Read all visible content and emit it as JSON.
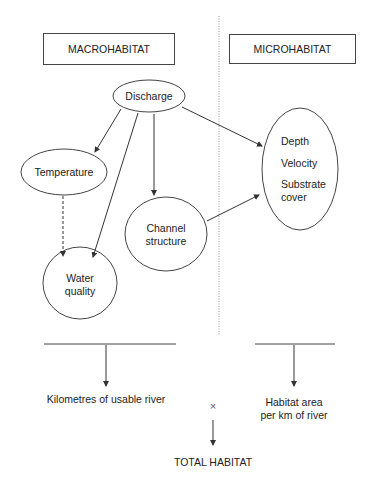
{
  "headers": {
    "left": "MACROHABITAT",
    "right": "MICROHABITAT"
  },
  "nodes": {
    "discharge": "Discharge",
    "temperature": "Temperature",
    "water_quality_1": "Water",
    "water_quality_2": "quality",
    "channel_1": "Channel",
    "channel_2": "structure",
    "micro_depth": "Depth",
    "micro_velocity": "Velocity",
    "micro_substrate_1": "Substrate",
    "micro_substrate_2": "cover"
  },
  "outputs": {
    "left": "Kilometres of usable river",
    "right_1": "Habitat area",
    "right_2": "per km of river",
    "multiply": "×",
    "total": "TOTAL HABITAT"
  },
  "colors": {
    "line": "#333333",
    "divider": "#999999"
  }
}
